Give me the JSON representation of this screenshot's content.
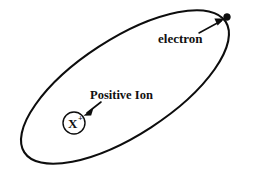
{
  "diagram": {
    "background_color": "#ffffff",
    "stroke_color": "#0d0d0d",
    "orbit": {
      "name": "electron-orbit-ellipse",
      "center_x": 125,
      "center_y": 87,
      "radius_x": 120,
      "radius_y": 48,
      "rotation_deg": -33,
      "stroke_width": 2.1
    },
    "electron": {
      "label": "electron",
      "dot_x": 227,
      "dot_y": 17,
      "dot_radius": 3.4,
      "label_x": 158,
      "label_y": 43,
      "pointer": {
        "from_x": 199,
        "from_y": 33,
        "to_x": 223,
        "to_y": 20,
        "stroke_width": 1.5
      }
    },
    "ion": {
      "label": "Positive Ion",
      "symbol": "X",
      "charge": "+",
      "circle_x": 74,
      "circle_y": 123,
      "circle_radius": 11,
      "circle_stroke_width": 1.4,
      "symbol_x": 69,
      "symbol_y": 128,
      "charge_x": 79,
      "charge_y": 121,
      "label_x": 90,
      "label_y": 99,
      "pointer": {
        "from_x": 101,
        "from_y": 102,
        "to_x": 84,
        "to_y": 115,
        "stroke_width": 1.6
      }
    }
  }
}
